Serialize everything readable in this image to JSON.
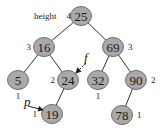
{
  "diagram": {
    "title_label": "height",
    "nodes": [
      {
        "id": "n25",
        "value": "25",
        "height": "4",
        "cx": 81,
        "cy": 16,
        "hx": 71,
        "hy": 16,
        "hanchor": "end"
      },
      {
        "id": "n16",
        "value": "16",
        "height": "3",
        "cx": 44,
        "cy": 47,
        "hx": 31,
        "hy": 47,
        "hanchor": "end"
      },
      {
        "id": "n69",
        "value": "69",
        "height": "3",
        "cx": 113,
        "cy": 47,
        "hx": 128,
        "hy": 47,
        "hanchor": "start"
      },
      {
        "id": "n5",
        "value": "5",
        "height": "1",
        "cx": 18,
        "cy": 80,
        "hx": 18,
        "hy": 96,
        "hanchor": "middle"
      },
      {
        "id": "n24",
        "value": "24",
        "height": "2",
        "cx": 68,
        "cy": 80,
        "hx": 55,
        "hy": 80,
        "hanchor": "end"
      },
      {
        "id": "n32",
        "value": "32",
        "height": "1",
        "cx": 98,
        "cy": 80,
        "hx": 98,
        "hy": 96,
        "hanchor": "middle"
      },
      {
        "id": "n90",
        "value": "90",
        "height": "2",
        "cx": 136,
        "cy": 80,
        "hx": 151,
        "hy": 80,
        "hanchor": "start"
      },
      {
        "id": "n19",
        "value": "19",
        "height": "1",
        "cx": 52,
        "cy": 114,
        "hx": 37,
        "hy": 114,
        "hanchor": "end"
      },
      {
        "id": "n78",
        "value": "78",
        "height": "1",
        "cx": 122,
        "cy": 115,
        "hx": 137,
        "hy": 115,
        "hanchor": "start"
      }
    ],
    "edges": [
      [
        "n25",
        "n16"
      ],
      [
        "n25",
        "n69"
      ],
      [
        "n16",
        "n5"
      ],
      [
        "n16",
        "n24"
      ],
      [
        "n69",
        "n32"
      ],
      [
        "n69",
        "n90"
      ],
      [
        "n24",
        "n19"
      ],
      [
        "n90",
        "n78"
      ]
    ],
    "pointers": [
      {
        "label": "f",
        "x": 86,
        "y": 63,
        "tx": 76,
        "ty": 73,
        "lx": 84,
        "ly": 62
      },
      {
        "label": "p",
        "x": 28,
        "y": 106,
        "tx": 43,
        "ty": 110,
        "lx": 24,
        "ly": 106
      }
    ],
    "colors": {
      "node_fill": "#a9a9a9",
      "node_stroke": "#6e6e6e",
      "edge": "#333333"
    }
  }
}
